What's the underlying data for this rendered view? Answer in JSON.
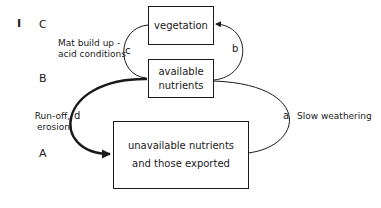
{
  "figure": {
    "panel_label": "I",
    "levels": [
      {
        "id": "C",
        "label": "C"
      },
      {
        "id": "B",
        "label": "B"
      },
      {
        "id": "A",
        "label": "A"
      }
    ],
    "boxes": {
      "vegetation": {
        "line1": "vegetation"
      },
      "available": {
        "line1": "available",
        "line2": "nutrients"
      },
      "unavailable": {
        "line1": "unavailable nutrients",
        "line2": "and those exported"
      }
    },
    "arrows": [
      {
        "id": "a",
        "letter": "a",
        "from": "unavailable",
        "to": "available",
        "label": "Slow weathering"
      },
      {
        "id": "b",
        "letter": "b",
        "from": "available",
        "to": "vegetation",
        "label": ""
      },
      {
        "id": "c",
        "letter": "c",
        "from": "vegetation",
        "to": "available",
        "label_line1": "Mat build up -",
        "label_line2": "acid conditions"
      },
      {
        "id": "d",
        "letter": "d",
        "from": "available",
        "to": "unavailable",
        "label_line1": "Run-off,",
        "label_line2": "erosion",
        "emphasis": "thick"
      }
    ]
  }
}
